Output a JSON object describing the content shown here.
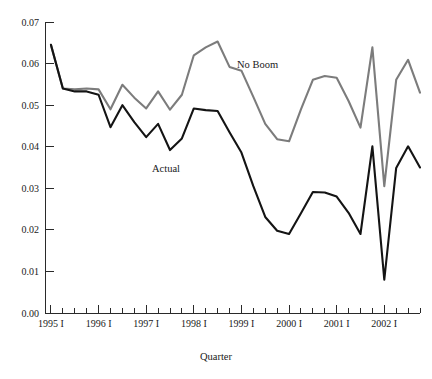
{
  "chart_data": {
    "type": "line",
    "title": "",
    "xlabel": "Quarter",
    "ylabel": "",
    "grid": false,
    "legend_position": "inline-annotation",
    "ylim": [
      0.0,
      0.07
    ],
    "ytick_values": [
      0.0,
      0.01,
      0.02,
      0.03,
      0.04,
      0.05,
      0.06,
      0.07
    ],
    "ytick_labels": [
      "0.00",
      "0.01",
      "0.02",
      "0.03",
      "0.04",
      "0.05",
      "0.06",
      "0.07"
    ],
    "x": [
      "1995 I",
      "1995 II",
      "1995 III",
      "1995 IV",
      "1996 I",
      "1996 II",
      "1996 III",
      "1996 IV",
      "1997 I",
      "1997 II",
      "1997 III",
      "1997 IV",
      "1998 I",
      "1998 II",
      "1998 III",
      "1998 IV",
      "1999 I",
      "1999 II",
      "1999 III",
      "1999 IV",
      "2000 I",
      "2000 II",
      "2000 III",
      "2000 IV",
      "2001 I",
      "2001 II",
      "2001 III",
      "2001 IV",
      "2002 I",
      "2002 II",
      "2002 III",
      "2002 IV"
    ],
    "xtick_labels": [
      "1995 I",
      "1996 I",
      "1997 I",
      "1998 I",
      "1999 I",
      "2000 I",
      "2001 I",
      "2002 I"
    ],
    "xtick_label_indices": [
      0,
      4,
      8,
      12,
      16,
      20,
      24,
      28
    ],
    "series": [
      {
        "name": "No Boom",
        "color": "#7c7c7c",
        "label_text": "No Boom",
        "values": [
          0.0645,
          0.054,
          0.0538,
          0.054,
          0.0538,
          0.049,
          0.0549,
          0.0518,
          0.0492,
          0.0533,
          0.0489,
          0.0525,
          0.062,
          0.0639,
          0.0653,
          0.0592,
          0.0583,
          0.052,
          0.0455,
          0.0418,
          0.0413,
          0.049,
          0.0561,
          0.057,
          0.0566,
          0.051,
          0.0446,
          0.0639,
          0.0305,
          0.0561,
          0.0609,
          0.053
        ]
      },
      {
        "name": "Actual",
        "color": "#141414",
        "label_text": "Actual",
        "values": [
          0.0645,
          0.054,
          0.0533,
          0.0533,
          0.0525,
          0.0447,
          0.05,
          0.0459,
          0.0423,
          0.0455,
          0.0392,
          0.042,
          0.0492,
          0.0488,
          0.0486,
          0.0435,
          0.0386,
          0.0305,
          0.0231,
          0.0198,
          0.019,
          0.024,
          0.0291,
          0.029,
          0.028,
          0.0241,
          0.019,
          0.0401,
          0.008,
          0.0349,
          0.0401,
          0.035
        ]
      }
    ],
    "annotations": [
      {
        "text": "No Boom",
        "x_px": 237,
        "y_px": 68
      },
      {
        "text": "Actual",
        "x_px": 152,
        "y_px": 172
      }
    ]
  },
  "axis": {
    "x_title": "Quarter"
  }
}
